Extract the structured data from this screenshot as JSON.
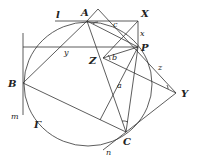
{
  "figure": {
    "title": "",
    "points": {
      "A": "A",
      "X": "X",
      "P": "P",
      "Z": "Z",
      "B": "B",
      "Y": "Y",
      "C": "C"
    },
    "lines": {
      "l": "l",
      "m": "m",
      "n": "n"
    },
    "segments": {
      "x": "x",
      "y": "y",
      "z": "z",
      "a": "a",
      "b": "b",
      "c": "c"
    },
    "circle": "Γ"
  },
  "colors": {
    "stroke": "#333333",
    "background": "#ffffff"
  }
}
